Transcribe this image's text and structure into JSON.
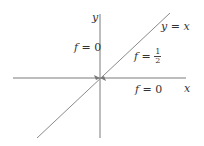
{
  "diagram": {
    "type": "coordinate-plane",
    "axes": {
      "x_label": "x",
      "y_label": "y"
    },
    "line": {
      "label": "y = x"
    },
    "regions": [
      {
        "label_f": "f",
        "label_eq": "=",
        "value": "0",
        "where": "upper-left"
      },
      {
        "label_f": "f",
        "label_eq": "=",
        "value_num": "1",
        "value_den": "2",
        "where": "on line y = x"
      },
      {
        "label_f": "f",
        "label_eq": "=",
        "value": "0",
        "where": "lower-right"
      }
    ],
    "colors": {
      "axis": "#7a7a7a",
      "line": "#8a8a8a",
      "text": "#333333"
    }
  }
}
